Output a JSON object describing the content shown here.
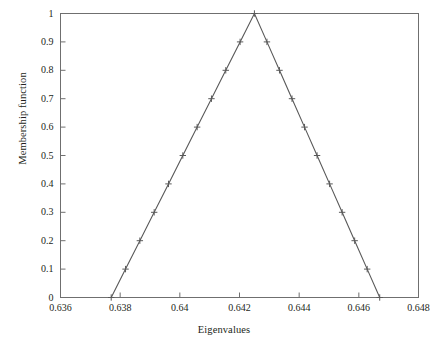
{
  "chart_data": {
    "type": "line",
    "title": "",
    "xlabel": "Eigenvalues",
    "ylabel": "Membership function",
    "xlim": [
      0.636,
      0.648
    ],
    "ylim": [
      0,
      1
    ],
    "xticks": [
      0.636,
      0.638,
      0.64,
      0.642,
      0.644,
      0.646,
      0.648
    ],
    "xtick_labels": [
      "0.636",
      "0.638",
      "0.64",
      "0.642",
      "0.644",
      "0.646",
      "0.648"
    ],
    "yticks": [
      0,
      0.1,
      0.2,
      0.3,
      0.4,
      0.5,
      0.6,
      0.7,
      0.8,
      0.9,
      1
    ],
    "ytick_labels": [
      "0",
      "0.1",
      "0.2",
      "0.3",
      "0.4",
      "0.5",
      "0.6",
      "0.7",
      "0.8",
      "0.9",
      "1"
    ],
    "grid": false,
    "legend": null,
    "line_color": "#595959",
    "marker": "plus",
    "series": [
      {
        "name": "Triangular membership function",
        "x": [
          0.6377,
          0.63818,
          0.63866,
          0.63914,
          0.63962,
          0.6401,
          0.64058,
          0.64106,
          0.64154,
          0.64202,
          0.6425,
          0.64292,
          0.64334,
          0.64376,
          0.64418,
          0.6446,
          0.64502,
          0.64544,
          0.64586,
          0.64628,
          0.6467
        ],
        "y": [
          0.0,
          0.1,
          0.2,
          0.3,
          0.4,
          0.5,
          0.6,
          0.7,
          0.8,
          0.9,
          1.0,
          0.9,
          0.8,
          0.7,
          0.6,
          0.5,
          0.4,
          0.3,
          0.2,
          0.1,
          0.0
        ]
      }
    ],
    "peak_x": 0.6425,
    "left_foot_x": 0.6377,
    "right_foot_x": 0.6467
  }
}
